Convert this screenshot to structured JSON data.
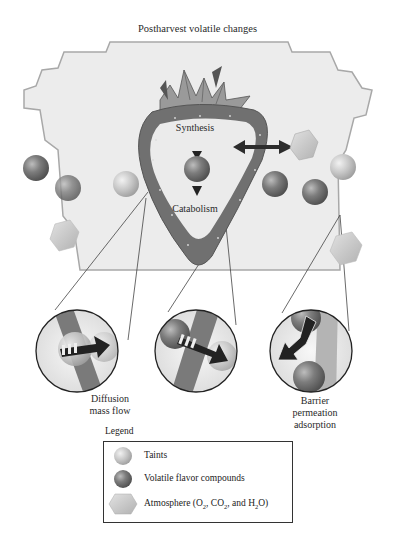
{
  "title": "Postharvest volatile changes",
  "strawberry": {
    "top_label": "Synthesis",
    "bottom_label": "Catabolism"
  },
  "callouts": [
    {
      "label_line1": "Diffusion",
      "label_line2": "mass flow"
    },
    {
      "label_line1": "",
      "label_line2": ""
    },
    {
      "label_line1": "Barrier",
      "label_line2": "permeation",
      "label_line3": "adsorption"
    }
  ],
  "legend": {
    "title": "Legend",
    "items": [
      {
        "icon": "light-sphere-icon",
        "label": "Taints"
      },
      {
        "icon": "dark-sphere-icon",
        "label": "Volatile flavor compounds"
      },
      {
        "icon": "hexagon-icon",
        "label_prefix": "Atmosphere (O",
        "sub1": "2",
        "mid1": ", CO",
        "sub2": "2",
        "mid2": ", and H",
        "sub3": "2",
        "suffix": "O)"
      }
    ]
  },
  "colors": {
    "package_fill": "#ededed",
    "package_stroke": "#a9a9a9",
    "strawberry_skin": "#6e6e6e",
    "strawberry_flesh": "#e9e9e9",
    "dark_sphere": "#7a7a7a",
    "light_sphere": "#c4c4c4",
    "hexagon": "#c8c8c8",
    "arrow": "#2b2b2b"
  }
}
